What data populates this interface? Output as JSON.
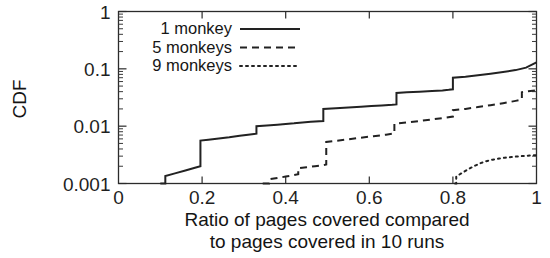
{
  "chart_data": {
    "type": "line",
    "title": "",
    "xlabel": "Ratio of pages covered compared to pages covered in 10 runs",
    "xlabel_line1": "Ratio of pages covered compared",
    "xlabel_line2": "to pages covered in 10 runs",
    "ylabel": "CDF",
    "xlim": [
      0,
      1
    ],
    "ylim": [
      0.001,
      1
    ],
    "yscale": "log",
    "xscale": "linear",
    "grid": false,
    "legend_position": "upper left inside",
    "xticks": [
      0,
      0.2,
      0.4,
      0.6,
      0.8,
      1
    ],
    "xticklabels": [
      "0",
      "0.2",
      "0.4",
      "0.6",
      "0.8",
      "1"
    ],
    "yticks": [
      0.001,
      0.01,
      0.1,
      1
    ],
    "yticklabels": [
      "0.001",
      "0.01",
      "0.1",
      "1"
    ],
    "series": [
      {
        "name": "1 monkey",
        "style": "solid",
        "points": [
          [
            0.1,
            0.001
          ],
          [
            0.112,
            0.001
          ],
          [
            0.112,
            0.00135
          ],
          [
            0.135,
            0.0015
          ],
          [
            0.16,
            0.00168
          ],
          [
            0.185,
            0.0019
          ],
          [
            0.196,
            0.002
          ],
          [
            0.196,
            0.0056
          ],
          [
            0.215,
            0.0058
          ],
          [
            0.24,
            0.0061
          ],
          [
            0.265,
            0.0064
          ],
          [
            0.29,
            0.0068
          ],
          [
            0.31,
            0.0071
          ],
          [
            0.33,
            0.0074
          ],
          [
            0.33,
            0.01
          ],
          [
            0.355,
            0.0103
          ],
          [
            0.38,
            0.0106
          ],
          [
            0.4,
            0.0109
          ],
          [
            0.42,
            0.0112
          ],
          [
            0.44,
            0.0116
          ],
          [
            0.46,
            0.0119
          ],
          [
            0.49,
            0.0123
          ],
          [
            0.49,
            0.02
          ],
          [
            0.52,
            0.0206
          ],
          [
            0.55,
            0.0212
          ],
          [
            0.58,
            0.0218
          ],
          [
            0.605,
            0.0224
          ],
          [
            0.63,
            0.023
          ],
          [
            0.655,
            0.0236
          ],
          [
            0.665,
            0.024
          ],
          [
            0.665,
            0.038
          ],
          [
            0.69,
            0.039
          ],
          [
            0.72,
            0.04
          ],
          [
            0.75,
            0.041
          ],
          [
            0.775,
            0.042
          ],
          [
            0.79,
            0.043
          ],
          [
            0.8,
            0.044
          ],
          [
            0.8,
            0.07
          ],
          [
            0.83,
            0.073
          ],
          [
            0.86,
            0.077
          ],
          [
            0.89,
            0.082
          ],
          [
            0.92,
            0.088
          ],
          [
            0.95,
            0.095
          ],
          [
            0.975,
            0.105
          ],
          [
            1.0,
            0.13
          ]
        ]
      },
      {
        "name": "5 monkeys",
        "style": "dashed",
        "points": [
          [
            0.345,
            0.001
          ],
          [
            0.36,
            0.001
          ],
          [
            0.36,
            0.00118
          ],
          [
            0.38,
            0.00125
          ],
          [
            0.4,
            0.00132
          ],
          [
            0.42,
            0.0014
          ],
          [
            0.43,
            0.00145
          ],
          [
            0.43,
            0.00185
          ],
          [
            0.45,
            0.00192
          ],
          [
            0.47,
            0.002
          ],
          [
            0.49,
            0.00208
          ],
          [
            0.497,
            0.00215
          ],
          [
            0.497,
            0.0053
          ],
          [
            0.52,
            0.00555
          ],
          [
            0.55,
            0.0059
          ],
          [
            0.58,
            0.0063
          ],
          [
            0.61,
            0.0067
          ],
          [
            0.64,
            0.0071
          ],
          [
            0.66,
            0.00745
          ],
          [
            0.66,
            0.011
          ],
          [
            0.69,
            0.0116
          ],
          [
            0.72,
            0.0123
          ],
          [
            0.75,
            0.0131
          ],
          [
            0.78,
            0.014
          ],
          [
            0.8,
            0.0147
          ],
          [
            0.8,
            0.019
          ],
          [
            0.83,
            0.02
          ],
          [
            0.86,
            0.0215
          ],
          [
            0.89,
            0.0232
          ],
          [
            0.92,
            0.0252
          ],
          [
            0.95,
            0.0276
          ],
          [
            0.965,
            0.029
          ],
          [
            0.965,
            0.039
          ],
          [
            0.98,
            0.0405
          ],
          [
            1.0,
            0.042
          ]
        ]
      },
      {
        "name": "9 monkeys",
        "style": "dotted",
        "points": [
          [
            0.805,
            0.001
          ],
          [
            0.808,
            0.001
          ],
          [
            0.808,
            0.00132
          ],
          [
            0.82,
            0.0015
          ],
          [
            0.835,
            0.00175
          ],
          [
            0.85,
            0.002
          ],
          [
            0.865,
            0.00225
          ],
          [
            0.88,
            0.00245
          ],
          [
            0.895,
            0.0026
          ],
          [
            0.91,
            0.00272
          ],
          [
            0.925,
            0.00282
          ],
          [
            0.94,
            0.0029
          ],
          [
            0.955,
            0.00297
          ],
          [
            0.97,
            0.00303
          ],
          [
            0.985,
            0.00308
          ],
          [
            1.0,
            0.00312
          ]
        ]
      }
    ]
  },
  "legend": {
    "entries": [
      {
        "label": "1 monkey",
        "style": "solid"
      },
      {
        "label": "5 monkeys",
        "style": "dashed"
      },
      {
        "label": "9 monkeys",
        "style": "dotted"
      }
    ]
  },
  "colors": {
    "ink": "#222222",
    "background": "#ffffff"
  }
}
